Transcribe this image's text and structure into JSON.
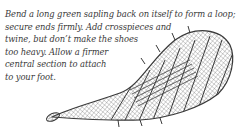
{
  "caption": {
    "lines": [
      "Bend a long green sapling back on itself to form a loop;",
      "secure ends firmly. Add crosspieces and",
      "twine, but don’t make the shoes",
      "too heavy. Allow a firmer",
      "central section to attach",
      "to your foot."
    ]
  },
  "illustration": {
    "subject": "snowshoe",
    "ink_color": "#3a3a3a"
  }
}
